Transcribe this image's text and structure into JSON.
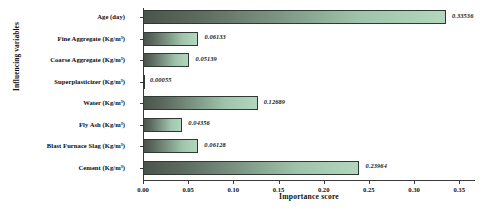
{
  "chart_data": {
    "type": "bar",
    "orientation": "horizontal",
    "title": "",
    "xlabel": "Importance score",
    "ylabel": "Influencing variables",
    "xlim": [
      0.0,
      0.3675
    ],
    "grid": false,
    "legend": null,
    "xticks": [
      "0.00",
      "0.05",
      "0.10",
      "0.15",
      "0.20",
      "0.25",
      "0.30",
      "0.35"
    ],
    "xtick_values": [
      0.0,
      0.05,
      0.1,
      0.15,
      0.2,
      0.25,
      0.3,
      0.35
    ],
    "categories": [
      "Age (day)",
      "Fine Aggregate (Kg/m³)",
      "Coarse Aggregate (Kg/m³)",
      "Superplasticizer (Kg/m³)",
      "Water (Kg/m³)",
      "Fly Ash (Kg/m³)",
      "Blast Furnace Slag (Kg/m³)",
      "Cement (Kg/m³)"
    ],
    "values": [
      0.33536,
      0.06133,
      0.05139,
      0.00055,
      0.12689,
      0.04356,
      0.06128,
      0.23964
    ],
    "value_labels": [
      "0.33536",
      "0.06133",
      "0.05139",
      "0.00055",
      "0.12689",
      "0.04356",
      "0.06128",
      "0.23964"
    ],
    "bars": [
      {
        "label": "Age (day)",
        "base": "Age",
        "unit": "(day)",
        "sup": "",
        "value": 0.33536,
        "value_label": "0.33536"
      },
      {
        "label": "Fine Aggregate (Kg/m³)",
        "base": "Fine Aggregate",
        "unit": "(Kg/m",
        "sup": "3",
        "value": 0.06133,
        "value_label": "0.06133"
      },
      {
        "label": "Coarse Aggregate (Kg/m³)",
        "base": "Coarse Aggregate",
        "unit": "(Kg/m",
        "sup": "3",
        "value": 0.05139,
        "value_label": "0.05139"
      },
      {
        "label": "Superplasticizer (Kg/m³)",
        "base": "Superplasticizer",
        "unit": "(Kg/m",
        "sup": "3",
        "value": 0.00055,
        "value_label": "0.00055"
      },
      {
        "label": "Water (Kg/m³)",
        "base": "Water",
        "unit": "(Kg/m",
        "sup": "3",
        "value": 0.12689,
        "value_label": "0.12689"
      },
      {
        "label": "Fly Ash (Kg/m³)",
        "base": "Fly Ash",
        "unit": "(Kg/m",
        "sup": "3",
        "value": 0.04356,
        "value_label": "0.04356"
      },
      {
        "label": "Blast Furnace Slag (Kg/m³)",
        "base": "Blast Furnace Slag",
        "unit": "(Kg/m",
        "sup": "3",
        "value": 0.06128,
        "value_label": "0.06128"
      },
      {
        "label": "Cement (Kg/m³)",
        "base": "Cement",
        "unit": "(Kg/m",
        "sup": "3",
        "value": 0.23964,
        "value_label": "0.23964"
      }
    ],
    "colors": {
      "bar_gradient_start": "#4a544c",
      "bar_gradient_end": "#b3d7bd",
      "bar_border": "#2f3a33",
      "axis": "#3a3a3a",
      "text": "#111111",
      "background": "#ffffff"
    }
  }
}
